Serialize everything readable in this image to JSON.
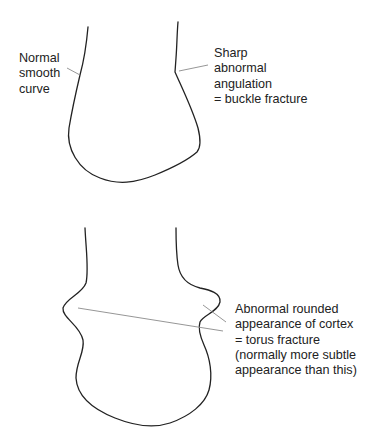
{
  "diagram": {
    "type": "anatomical-line-diagram",
    "colors": {
      "background": "#ffffff",
      "outline": "#222222",
      "pointer": "#8a8a8a",
      "text": "#222222"
    },
    "panels": [
      {
        "id": "buckle",
        "labels": {
          "left": {
            "lines": [
              "Normal",
              "smooth",
              "curve"
            ]
          },
          "right": {
            "lines": [
              "Sharp",
              "abnormal",
              "angulation",
              "= buckle fracture"
            ]
          }
        }
      },
      {
        "id": "torus",
        "labels": {
          "right": {
            "lines": [
              "Abnormal rounded",
              "appearance of cortex",
              "= torus fracture",
              "(normally more subtle",
              "appearance than this)"
            ]
          }
        }
      }
    ]
  }
}
